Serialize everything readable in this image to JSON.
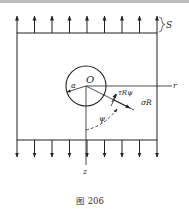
{
  "figure": {
    "caption": "图 206",
    "labels": {
      "stress": "S",
      "origin": "O",
      "radius": "a",
      "r_axis": "r",
      "z_axis": "z",
      "shear": "τRψ",
      "normal": "σR",
      "angle": "ψ"
    },
    "colors": {
      "ink": "#222222",
      "background": "#ffffff"
    },
    "top_arrows_count": 9,
    "bottom_arrows_count": 9
  }
}
